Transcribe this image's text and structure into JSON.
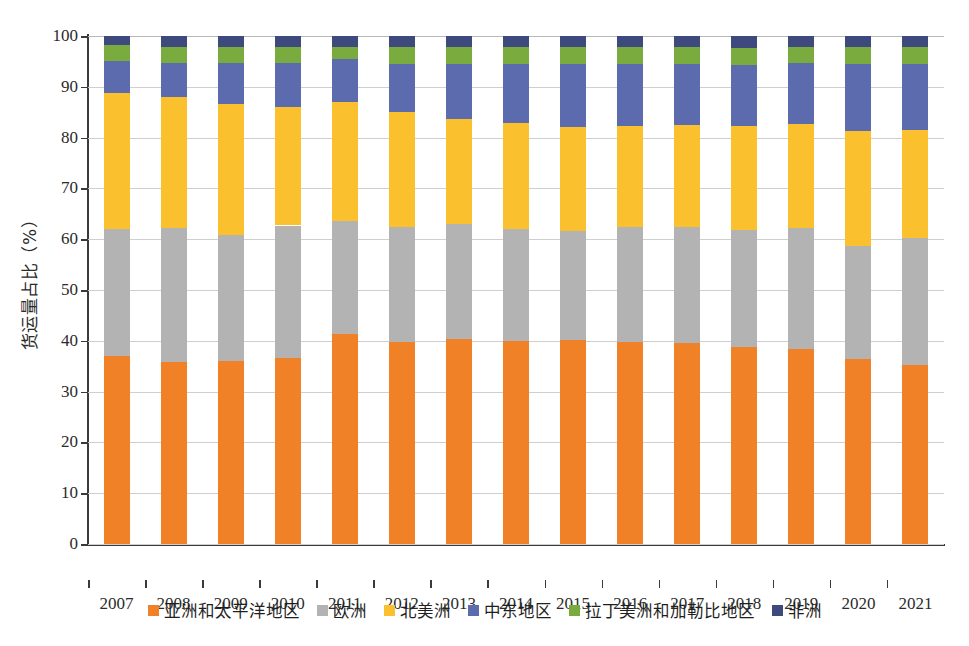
{
  "chart_data": {
    "type": "bar",
    "subtype": "stacked-percentage-column",
    "title": "",
    "xlabel": "",
    "ylabel": "货运量占比（%）",
    "ylim": [
      0,
      100
    ],
    "ytick_step": 10,
    "grid": true,
    "legend_position": "bottom",
    "categories": [
      "2007",
      "2008",
      "2009",
      "2010",
      "2011",
      "2012",
      "2013",
      "2014",
      "2015",
      "2016",
      "2017",
      "2018",
      "2019",
      "2020",
      "2021"
    ],
    "ytick_labels": [
      "0",
      "10",
      "20",
      "30",
      "40",
      "50",
      "60",
      "70",
      "80",
      "90",
      "100"
    ],
    "series": [
      {
        "name": "亚洲和太平洋地区",
        "color": "#F08127",
        "values": [
          37.0,
          35.8,
          36.1,
          36.6,
          41.4,
          39.8,
          40.4,
          39.9,
          40.2,
          39.8,
          39.5,
          38.8,
          38.4,
          36.5,
          35.2
        ]
      },
      {
        "name": "欧洲",
        "color": "#B3B3B3",
        "values": [
          25.1,
          26.4,
          24.7,
          26.1,
          22.2,
          22.7,
          22.5,
          22.1,
          21.5,
          22.7,
          22.9,
          23.0,
          23.8,
          22.2,
          25.0
        ]
      },
      {
        "name": "北美洲",
        "color": "#FBC02D",
        "values": [
          26.7,
          25.8,
          25.8,
          23.4,
          23.4,
          22.5,
          20.8,
          20.8,
          20.3,
          19.7,
          20.0,
          20.4,
          20.4,
          22.6,
          21.3
        ]
      },
      {
        "name": "中东地区",
        "color": "#5B6BAE",
        "values": [
          6.2,
          6.7,
          8.1,
          8.5,
          8.5,
          9.5,
          10.8,
          11.7,
          12.5,
          12.3,
          12.0,
          12.1,
          12.0,
          13.2,
          13.0
        ]
      },
      {
        "name": "拉丁美洲和加勒比地区",
        "color": "#7AAB3F",
        "values": [
          3.3,
          3.2,
          3.2,
          3.3,
          2.4,
          3.3,
          3.3,
          3.3,
          3.3,
          3.3,
          3.4,
          3.4,
          3.2,
          3.3,
          3.3
        ]
      },
      {
        "name": "非洲",
        "color": "#3E4A7E",
        "values": [
          1.7,
          2.1,
          2.1,
          2.1,
          2.1,
          2.2,
          2.2,
          2.2,
          2.2,
          2.2,
          2.2,
          2.3,
          2.2,
          2.2,
          2.2
        ]
      }
    ]
  }
}
